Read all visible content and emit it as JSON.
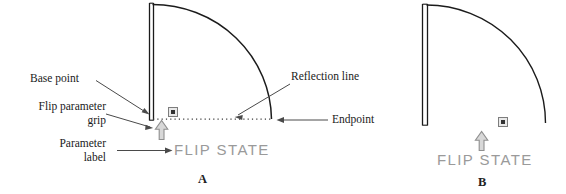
{
  "figure": {
    "panels": [
      {
        "id": "A",
        "caption": "A",
        "parameter_label": "FLIP  STATE",
        "annotations": [
          {
            "name": "base-point",
            "text": "Base point"
          },
          {
            "name": "flip-parameter-grip",
            "text": "Flip parameter\ngrip",
            "line1": "Flip parameter",
            "line2": "grip"
          },
          {
            "name": "parameter-label",
            "text": "Parameter\nlabel",
            "line1": "Parameter",
            "line2": "label"
          },
          {
            "name": "reflection-line",
            "text": "Reflection line"
          },
          {
            "name": "endpoint",
            "text": "Endpoint"
          }
        ]
      },
      {
        "id": "B",
        "caption": "B",
        "parameter_label": "FLIP  STATE",
        "annotations": []
      }
    ],
    "colors": {
      "geometry_stroke": "#1b1b1b",
      "annotation_text": "#1a1a1a",
      "leader_line": "#4a4a4a",
      "reflection_line": "#3a3a3a",
      "parameter_label_text": "#9a9a9a",
      "grip_arrow_fill": "#d8d8d8",
      "grip_arrow_stroke": "#8f8f8f",
      "grip_square_fill": "#e2e2e2",
      "grip_square_stroke": "#7d7d7d",
      "background": "#ffffff"
    }
  }
}
